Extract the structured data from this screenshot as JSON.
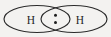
{
  "diagram": {
    "type": "lewis-overlap-venn",
    "background_color": "#f3f2f0",
    "stroke_color": "#2b2b2b",
    "label_color": "#1f1f1f",
    "dot_color": "#1f1f1f",
    "atoms": [
      {
        "id": "left-atom",
        "label": "H",
        "ellipse": {
          "cx": 37,
          "cy": 19,
          "rx": 33,
          "ry": 13.5
        },
        "label_x": 31,
        "label_y": 19
      },
      {
        "id": "right-atom",
        "label": "H",
        "ellipse": {
          "cx": 74,
          "cy": 19,
          "rx": 33,
          "ry": 13.5
        },
        "label_x": 80,
        "label_y": 19
      }
    ],
    "shared_pair": {
      "name": "shared-electron-pair",
      "count": 2,
      "dots": [
        {
          "cx": 55.5,
          "cy": 15.2,
          "r": 1.5
        },
        {
          "cx": 55.5,
          "cy": 22.4,
          "r": 1.5
        }
      ]
    }
  }
}
